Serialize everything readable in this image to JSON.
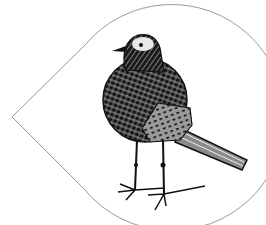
{
  "image": {
    "subject": "hand-drawn crosshatched bird standing inside a teardrop outline",
    "frame_shape": "teardrop",
    "colors": {
      "background": "#ffffff",
      "outline": "#9a9a9a",
      "ink": "#111111",
      "highlight": "#e8e8e8"
    }
  }
}
